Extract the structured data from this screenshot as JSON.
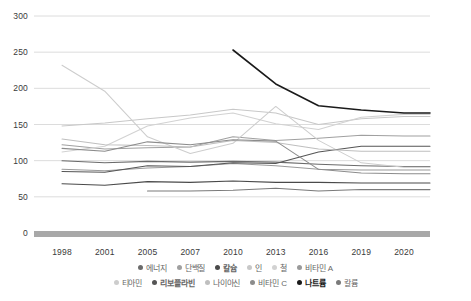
{
  "chart_data": {
    "type": "line",
    "title": "",
    "subtitle": "",
    "xlabel": "",
    "ylabel": "",
    "categories": [
      "1998",
      "2001",
      "2005",
      "2007",
      "2010",
      "2013",
      "2016",
      "2019",
      "2020"
    ],
    "ylim": [
      0,
      300
    ],
    "yticks": [
      0,
      50,
      100,
      150,
      200,
      250,
      300
    ],
    "grid": true,
    "legend_position": "bottom",
    "series": [
      {
        "name": "에너지",
        "color": "#6b6b6b",
        "values": [
          100,
          97,
          99,
          98,
          99,
          98,
          95,
          93,
          92
        ]
      },
      {
        "name": "단백질",
        "color": "#a0a0a0",
        "values": [
          122,
          116,
          118,
          119,
          133,
          128,
          131,
          135,
          134
        ]
      },
      {
        "name": "칼슘",
        "color": "#4a4a4a",
        "values": [
          68,
          66,
          71,
          70,
          72,
          70,
          70,
          69,
          69
        ]
      },
      {
        "name": "인",
        "color": "#c8c8c8",
        "values": [
          148,
          152,
          158,
          163,
          171,
          166,
          150,
          158,
          161
        ]
      },
      {
        "name": "철",
        "color": "#d2d2d2",
        "values": [
          112,
          120,
          148,
          159,
          166,
          151,
          143,
          160,
          164
        ]
      },
      {
        "name": "비타민 A",
        "color": "#9a9a9a",
        "values": [
          88,
          86,
          90,
          92,
          96,
          93,
          88,
          87,
          87
        ]
      },
      {
        "name": "티아민",
        "color": "#cdcdcd",
        "values": [
          232,
          196,
          133,
          110,
          124,
          175,
          128,
          97,
          91
        ]
      },
      {
        "name": "리보플라빈",
        "color": "#555555",
        "values": [
          85,
          84,
          93,
          92,
          97,
          96,
          112,
          120,
          120
        ]
      },
      {
        "name": "나이아신",
        "color": "#bfbfbf",
        "values": [
          130,
          122,
          121,
          119,
          128,
          125,
          116,
          113,
          113
        ]
      },
      {
        "name": "비타민 C",
        "color": "#8c8c8c",
        "values": [
          117,
          113,
          126,
          122,
          129,
          127,
          88,
          83,
          82
        ]
      },
      {
        "name": "나트륨",
        "color": "#1a1a1a",
        "values": [
          null,
          null,
          null,
          null,
          253,
          206,
          176,
          170,
          166
        ]
      },
      {
        "name": "칼륨",
        "color": "#7a7a7a",
        "values": [
          null,
          null,
          58,
          58,
          59,
          62,
          58,
          60,
          60
        ]
      }
    ]
  },
  "axis": {
    "ytick_labels": [
      "300",
      "250",
      "200",
      "150",
      "100",
      "50",
      "0"
    ],
    "xtick_labels": [
      "1998",
      "2001",
      "2005",
      "2007",
      "2010",
      "2013",
      "2016",
      "2019",
      "2020"
    ]
  },
  "legend": {
    "row1": [
      {
        "label": "에너지",
        "color": "#6b6b6b"
      },
      {
        "label": "단백질",
        "color": "#a0a0a0"
      },
      {
        "label": "칼슘",
        "color": "#4a4a4a"
      },
      {
        "label": "인",
        "color": "#c8c8c8"
      },
      {
        "label": "철",
        "color": "#d2d2d2"
      },
      {
        "label": "비타민 A",
        "color": "#9a9a9a"
      }
    ],
    "row2": [
      {
        "label": "티아민",
        "color": "#cdcdcd"
      },
      {
        "label": "리보플라빈",
        "color": "#555555"
      },
      {
        "label": "나이아신",
        "color": "#bfbfbf"
      },
      {
        "label": "비타민 C",
        "color": "#8c8c8c"
      },
      {
        "label": "나트륨",
        "color": "#1a1a1a"
      },
      {
        "label": "칼륨",
        "color": "#7a7a7a"
      }
    ]
  },
  "style": {
    "grid_color": "#dcdcdc",
    "axis_text_color": "#3a3a3a",
    "baseline_color": "#a8a8a8",
    "background": "#ffffff"
  }
}
